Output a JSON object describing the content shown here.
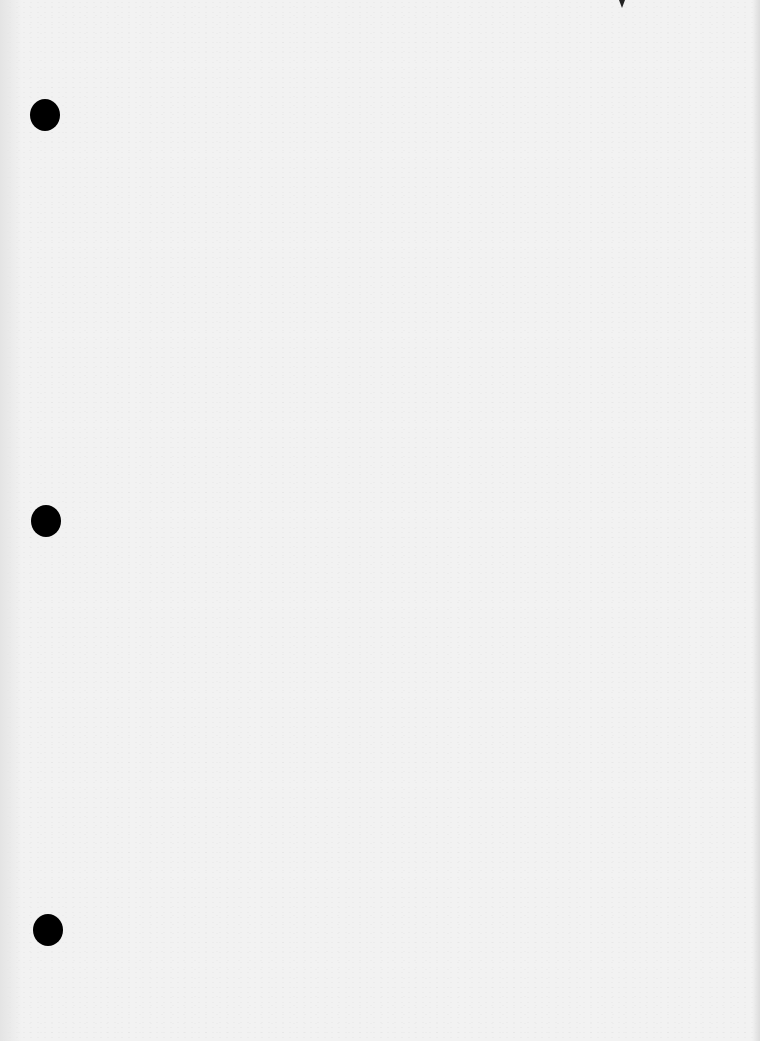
{
  "document": {
    "type": "scanned-blank-page",
    "text_content": "",
    "binder_holes": [
      {
        "name": "hole-top",
        "x": 30,
        "y": 99
      },
      {
        "name": "hole-middle",
        "x": 31,
        "y": 505
      },
      {
        "name": "hole-bottom",
        "x": 33,
        "y": 914
      }
    ],
    "colors": {
      "paper": "#f2f2f2",
      "hole": "#000000"
    }
  }
}
